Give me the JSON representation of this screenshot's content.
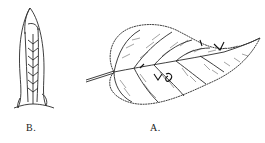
{
  "illustration": {
    "style": "botanical line engraving",
    "ink_color": "#2a2a2a",
    "background": "#ffffff",
    "figures": [
      {
        "id": "B",
        "label": "B.",
        "subject": "rolled leaf shelter / folded leaf"
      },
      {
        "id": "A",
        "label": "A.",
        "subject": "heart-shaped serrated leaf with insect damage marks"
      }
    ]
  }
}
